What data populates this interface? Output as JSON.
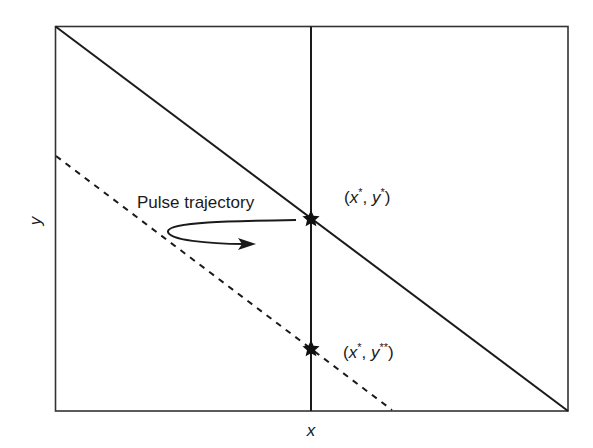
{
  "diagram": {
    "type": "phase-plane",
    "frame": {
      "x0": 55,
      "y0": 26,
      "x1": 568,
      "y1": 411
    },
    "axes": {
      "x_label": "x",
      "y_label": "y"
    },
    "lines": [
      {
        "name": "solid-diagonal",
        "style": "solid",
        "from": [
          55,
          26
        ],
        "to": [
          568,
          411
        ]
      },
      {
        "name": "dashed-diagonal",
        "style": "dashed",
        "from": [
          55,
          156
        ],
        "to": [
          392,
          411
        ]
      },
      {
        "name": "vertical-x-star",
        "style": "solid",
        "from": [
          311,
          26
        ],
        "to": [
          311,
          411
        ]
      }
    ],
    "points": [
      {
        "name": "equilibrium",
        "label_open": "(",
        "x": "x",
        "x_sup": "*",
        "sep": ", ",
        "y": "y",
        "y_sup": "*",
        "label_close": ")",
        "position": [
          311,
          219
        ]
      },
      {
        "name": "post-pulse",
        "label_open": "(",
        "x": "x",
        "x_sup": "*",
        "sep": ", ",
        "y": "y",
        "y_sup": "**",
        "label_close": ")",
        "position": [
          311,
          349
        ]
      }
    ],
    "annotation": {
      "text": "Pulse trajectory",
      "arrow": "curved, from equilibrium star looping left then pointing right"
    },
    "colors": {
      "stroke": "#1a1a1a",
      "frame": "#333333",
      "background": "#ffffff"
    }
  }
}
